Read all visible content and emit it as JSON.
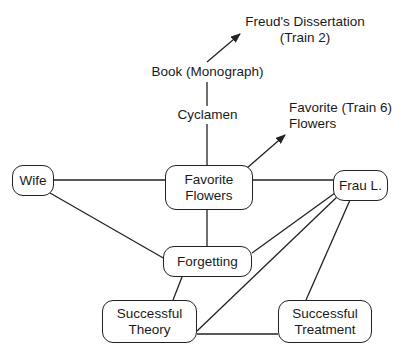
{
  "diagram": {
    "colors": {
      "line": "#222222",
      "text": "#1a1a1a",
      "background": "#ffffff"
    },
    "nodes": {
      "wife": "Wife",
      "favorite_flowers": "Favorite\nFlowers",
      "frau_l": "Frau L.",
      "forgetting": "Forgetting",
      "successful_theory": "Successful\nTheory",
      "successful_treatment": "Successful\nTreatment"
    },
    "labels": {
      "freuds_dissertation": "Freud's Dissertation\n(Train 2)",
      "book_monograph": "Book (Monograph)",
      "cyclamen": "Cyclamen",
      "favorite_train6": "Favorite (Train 6)\nFlowers"
    },
    "edges": [
      {
        "from": "Book (Monograph)",
        "to": "Freud's Dissertation (Train 2)",
        "arrow": true
      },
      {
        "from": "Book (Monograph)",
        "to": "Cyclamen",
        "arrow": false
      },
      {
        "from": "Cyclamen",
        "to": "Favorite Flowers",
        "arrow": false
      },
      {
        "from": "Favorite Flowers",
        "to": "Favorite (Train 6) Flowers",
        "arrow": true
      },
      {
        "from": "Wife",
        "to": "Favorite Flowers",
        "arrow": false
      },
      {
        "from": "Wife",
        "to": "Forgetting",
        "arrow": false
      },
      {
        "from": "Favorite Flowers",
        "to": "Frau L.",
        "arrow": false
      },
      {
        "from": "Favorite Flowers",
        "to": "Forgetting",
        "arrow": false
      },
      {
        "from": "Frau L.",
        "to": "Forgetting",
        "arrow": false
      },
      {
        "from": "Frau L.",
        "to": "Successful Theory",
        "arrow": false
      },
      {
        "from": "Frau L.",
        "to": "Successful Treatment",
        "arrow": false
      },
      {
        "from": "Forgetting",
        "to": "Successful Theory",
        "arrow": false
      },
      {
        "from": "Successful Theory",
        "to": "Successful Treatment",
        "arrow": false
      }
    ]
  }
}
